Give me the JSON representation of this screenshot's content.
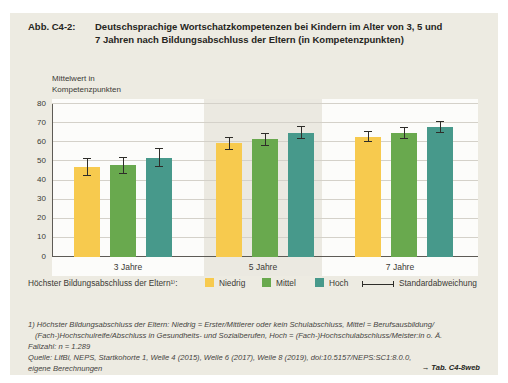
{
  "figure": {
    "label": "Abb. C4-2:",
    "title": "Deutschsprachige Wortschatzkompetenzen bei Kindern im Alter von 3, 5 und 7 Jahren nach Bildungsabschluss der Eltern (in Kompetenzpunkten)",
    "title_lines": [
      "Deutschsprachige Wortschatzkompetenzen bei Kindern im Alter von 3, 5 und",
      "7 Jahren nach Bildungsabschluss der Eltern (in Kompetenzpunkten)"
    ]
  },
  "chart_data": {
    "type": "bar",
    "title": "Deutschsprachige Wortschatzkompetenzen bei Kindern im Alter von 3, 5 und 7 Jahren nach Bildungsabschluss der Eltern (in Kompetenzpunkten)",
    "ylabel": "Mittelwert in Kompetenzpunkten",
    "xlabel": "",
    "ylim": [
      0,
      80
    ],
    "yticks": [
      0,
      10,
      20,
      30,
      40,
      50,
      60,
      70,
      80
    ],
    "grid": true,
    "legend_position": "bottom",
    "categories": [
      "3 Jahre",
      "5 Jahre",
      "7 Jahre"
    ],
    "series": [
      {
        "name": "Niedrig",
        "color": "#f7ca4e",
        "values": [
          47,
          59.5,
          63
        ],
        "std_dev": [
          4.7,
          3.5,
          3.0
        ]
      },
      {
        "name": "Mittel",
        "color": "#69a94e",
        "values": [
          48,
          61.5,
          65
        ],
        "std_dev": [
          4.5,
          3.5,
          3.2
        ]
      },
      {
        "name": "Hoch",
        "color": "#47998b",
        "values": [
          52,
          65,
          68
        ],
        "std_dev": [
          4.8,
          3.5,
          3.2
        ]
      }
    ]
  },
  "legend": {
    "label": "Höchster Bildungsabschluss der Eltern¹⁾:",
    "errorbar_label": "Standardabweichung"
  },
  "footnotes": {
    "lines": [
      {
        "text": "1) Höchster Bildungsabschluss der Eltern: Niedrig = Erster/Mittlerer oder kein Schulabschluss, Mittel = Berufsausbildung/",
        "indent": false
      },
      {
        "text": "(Fach-)Hochschulreife/Abschluss in Gesundheits- und Sozialberufen, Hoch = (Fach-)Hochschulabschluss/Meister:in o. Ä.",
        "indent": true
      },
      {
        "text": "Fallzahl: n = 1.289",
        "indent": false
      },
      {
        "text": "Quelle: LIfBi, NEPS, Startkohorte 1, Welle 4 (2015), Welle 6 (2017), Welle 8 (2019), doi:10.5157/NEPS:SC1:8.0.0,",
        "indent": false
      },
      {
        "text": "eigene Berechnungen",
        "indent": false
      }
    ]
  },
  "link": "→ Tab. C4-8web"
}
